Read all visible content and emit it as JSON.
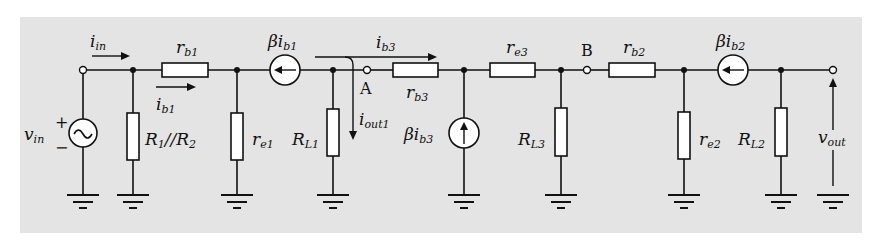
{
  "diagram": {
    "type": "small-signal equivalent circuit",
    "background": "#e4e4e4",
    "source": {
      "label": "v",
      "sub": "in",
      "plus": "+",
      "minus": "−"
    },
    "currents": {
      "i_in": {
        "label": "i",
        "sub": "in"
      },
      "i_b1": {
        "label": "i",
        "sub": "b1"
      },
      "i_b3": {
        "label": "i",
        "sub": "b3"
      },
      "i_out1": {
        "label": "i",
        "sub": "out1"
      }
    },
    "resistors": {
      "r_b1": {
        "label": "r",
        "sub": "b1"
      },
      "R1R2": {
        "label": "R",
        "sub": "1",
        "mid": "//R",
        "sub2": "2"
      },
      "r_e1": {
        "label": "r",
        "sub": "e1"
      },
      "R_L1": {
        "label": "R",
        "sub": "L1"
      },
      "r_b3": {
        "label": "r",
        "sub": "b3"
      },
      "r_e3": {
        "label": "r",
        "sub": "e3"
      },
      "R_L3": {
        "label": "R",
        "sub": "L3"
      },
      "r_b2": {
        "label": "r",
        "sub": "b2"
      },
      "r_e2": {
        "label": "r",
        "sub": "e2"
      },
      "R_L2": {
        "label": "R",
        "sub": "L2"
      }
    },
    "dependent_sources": {
      "beta_ib1": {
        "label": "βi",
        "sub": "b1"
      },
      "beta_ib3": {
        "label": "βi",
        "sub": "b3"
      },
      "beta_ib2": {
        "label": "βi",
        "sub": "b2"
      }
    },
    "nodes": {
      "A": "A",
      "B": "B"
    },
    "output": {
      "label": "v",
      "sub": "out"
    }
  }
}
